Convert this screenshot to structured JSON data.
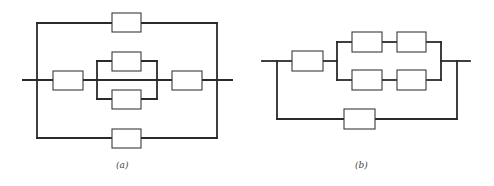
{
  "figure": {
    "diagrams": [
      {
        "id": "a",
        "caption": "(a)",
        "caption_pos": {
          "x": 116,
          "y": 160
        },
        "description": "Series-parallel reliability block diagram: outer parallel of three paths (top block, middle series chain, bottom block); middle chain = block, parallel pair of blocks, block",
        "wires": [
          {
            "x1": 23,
            "y1": 80,
            "x2": 232,
            "y2": 80,
            "segment": "main-line-left",
            "split": [
              [
                23,
                80
              ],
              [
                53,
                80
              ]
            ]
          },
          {
            "x1": 37,
            "y1": 23,
            "x2": 37,
            "y2": 138
          },
          {
            "x1": 217,
            "y1": 23,
            "x2": 217,
            "y2": 138
          },
          {
            "x1": 37,
            "y1": 23,
            "x2": 217,
            "y2": 23
          },
          {
            "x1": 37,
            "y1": 138,
            "x2": 217,
            "y2": 138
          },
          {
            "x1": 83,
            "y1": 80,
            "x2": 97,
            "y2": 80
          },
          {
            "x1": 97,
            "y1": 61,
            "x2": 97,
            "y2": 99
          },
          {
            "x1": 157,
            "y1": 61,
            "x2": 157,
            "y2": 99
          },
          {
            "x1": 97,
            "y1": 61,
            "x2": 157,
            "y2": 61
          },
          {
            "x1": 97,
            "y1": 99,
            "x2": 157,
            "y2": 99
          },
          {
            "x1": 157,
            "y1": 80,
            "x2": 172,
            "y2": 80
          },
          {
            "x1": 202,
            "y1": 80,
            "x2": 232,
            "y2": 80
          },
          {
            "x1": 23,
            "y1": 80,
            "x2": 53,
            "y2": 80
          }
        ],
        "blocks": [
          {
            "name": "block-top",
            "x": 112,
            "y": 13,
            "w": 29,
            "h": 19
          },
          {
            "name": "block-left",
            "x": 53,
            "y": 71,
            "w": 30,
            "h": 19
          },
          {
            "name": "block-middle-upper",
            "x": 112,
            "y": 52,
            "w": 29,
            "h": 19
          },
          {
            "name": "block-middle-lower",
            "x": 112,
            "y": 90,
            "w": 29,
            "h": 19
          },
          {
            "name": "block-right",
            "x": 172,
            "y": 71,
            "w": 30,
            "h": 19
          },
          {
            "name": "block-bottom",
            "x": 112,
            "y": 129,
            "w": 29,
            "h": 19
          }
        ]
      },
      {
        "id": "b",
        "caption": "(b)",
        "caption_pos": {
          "x": 355,
          "y": 160
        },
        "description": "Reliability block diagram: block in series with two parallel branches of two series blocks each, whole chain in parallel with a single bottom bypass block",
        "wires": [
          {
            "x1": 262,
            "y1": 61,
            "x2": 292,
            "y2": 61
          },
          {
            "x1": 323,
            "y1": 61,
            "x2": 337,
            "y2": 61
          },
          {
            "x1": 337,
            "y1": 42,
            "x2": 337,
            "y2": 80
          },
          {
            "x1": 337,
            "y1": 42,
            "x2": 352,
            "y2": 42
          },
          {
            "x1": 337,
            "y1": 80,
            "x2": 352,
            "y2": 80
          },
          {
            "x1": 382,
            "y1": 42,
            "x2": 397,
            "y2": 42
          },
          {
            "x1": 382,
            "y1": 80,
            "x2": 397,
            "y2": 80
          },
          {
            "x1": 426,
            "y1": 42,
            "x2": 441,
            "y2": 42
          },
          {
            "x1": 426,
            "y1": 80,
            "x2": 441,
            "y2": 80
          },
          {
            "x1": 441,
            "y1": 42,
            "x2": 441,
            "y2": 80
          },
          {
            "x1": 441,
            "y1": 61,
            "x2": 470,
            "y2": 61
          },
          {
            "x1": 277,
            "y1": 61,
            "x2": 277,
            "y2": 119
          },
          {
            "x1": 457,
            "y1": 61,
            "x2": 457,
            "y2": 119
          },
          {
            "x1": 277,
            "y1": 119,
            "x2": 344,
            "y2": 119
          },
          {
            "x1": 375,
            "y1": 119,
            "x2": 457,
            "y2": 119
          }
        ],
        "blocks": [
          {
            "name": "block-left",
            "x": 292,
            "y": 51,
            "w": 31,
            "h": 20
          },
          {
            "name": "block-upper-1",
            "x": 352,
            "y": 32,
            "w": 30,
            "h": 20
          },
          {
            "name": "block-upper-2",
            "x": 397,
            "y": 32,
            "w": 29,
            "h": 20
          },
          {
            "name": "block-lower-1",
            "x": 352,
            "y": 70,
            "w": 30,
            "h": 20
          },
          {
            "name": "block-lower-2",
            "x": 397,
            "y": 70,
            "w": 29,
            "h": 20
          },
          {
            "name": "block-bottom",
            "x": 344,
            "y": 109,
            "w": 31,
            "h": 20
          }
        ]
      }
    ]
  }
}
